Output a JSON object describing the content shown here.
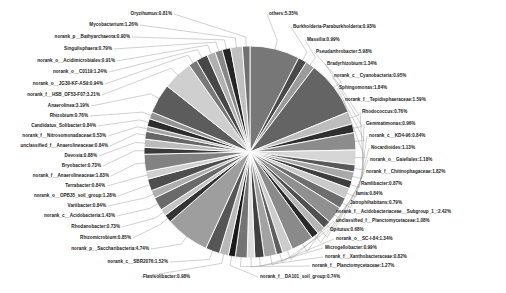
{
  "chart_data": {
    "type": "pie",
    "title": "",
    "xlabel": "",
    "ylabel": "",
    "legend_position": "none",
    "grid": false,
    "value_unit": "percent",
    "label_format": "{name}:{value}%",
    "slice_stroke": "#ffffff",
    "palette": "grayscale",
    "categories": [
      "others",
      "Burkholderia-Paraburkholderia",
      "Massilia",
      "Pseudarthrobacter",
      "Bradyrhizobium",
      "norank_c__Cyanobacteria",
      "Sphingomonas",
      "norank_f__Tepidisphaeraceae",
      "Rhodococcus",
      "Gemmatimonas",
      "norank_c__KD4-96",
      "Nocardioides",
      "norank_o__Gaiellales",
      "norank_f__Chitinophagaceae",
      "Ramlibacter",
      "Iamia",
      "Jatrophihabitans",
      "norank_f__Acidobacteriaceae__Subgroup_1_",
      "unclassified_f__Planctomycetaceae",
      "Opitutus",
      "norank_o__SC-I-84",
      "Microgellobacter",
      "norank_f__Xanthobacteraceae",
      "norank_f__Planctomycetaceae",
      "norank_f__DA101_soil_group",
      "Flavisolibacter",
      "norank_c__SBR2076",
      "norank_p__Saccharibacteria",
      "Rhizomicrobium",
      "Rhodanobacter",
      "norank_c__Acidobacteria",
      "Variibacter",
      "norank_o__OPB35_soil_group",
      "Terrabacter",
      "norank_f__Anaerolineaceae",
      "Bryobacter",
      "Devosia",
      "unclassified_f__Anaerolineaceae",
      "norank_f__Nitrosomonadaceae",
      "Candidatus_Solibacter",
      "Rhizobium",
      "Anaerolinea",
      "norank_f__HSB_OF53-F07",
      "norank_o__JG30-KF-AS9",
      "norank_o__C0119",
      "norank_o__Acidimicrobiales",
      "Singulisphaera",
      "norank_p__Bathyarchaeota",
      "Mycobacterium",
      "Oryzihumus"
    ],
    "values": [
      5.35,
      0.93,
      0.99,
      5.98,
      1.34,
      0.95,
      1.84,
      1.59,
      0.76,
      0.96,
      0.84,
      1.13,
      1.18,
      1.82,
      0.87,
      0.84,
      0.79,
      2.42,
      1.08,
      0.68,
      1.34,
      0.99,
      0.82,
      1.27,
      0.74,
      0.98,
      1.52,
      4.74,
      0.85,
      0.73,
      1.43,
      0.84,
      1.28,
      0.84,
      1.83,
      0.73,
      0.88,
      0.84,
      0.53,
      0.84,
      0.76,
      3.19,
      3.21,
      0.94,
      1.24,
      0.91,
      0.79,
      0.9,
      1.26,
      0.81
    ],
    "colors": [
      "#777777",
      "#4a4a4a",
      "#9b9b9b",
      "#646464",
      "#bdbdbd",
      "#2f2f2f",
      "#8c8c8c",
      "#d6d6d6",
      "#595959",
      "#a8a8a8",
      "#3d3d3d",
      "#c9c9c9",
      "#6e6e6e",
      "#909090",
      "#505050",
      "#b5b5b5",
      "#2a2a2a",
      "#8a8a8a",
      "#cccccc",
      "#5f5f5f",
      "#a2a2a2",
      "#404040",
      "#dddddd",
      "#747474",
      "#1a1a1a",
      "#b8b8b8",
      "#565656",
      "#9e9e9e",
      "#343434",
      "#c4c4c4",
      "#6a6a6a",
      "#adadad",
      "#4e4e4e",
      "#d0d0d0",
      "#828282",
      "#3a3a3a",
      "#bbbbbb",
      "#666666",
      "#a5a5a5",
      "#2d2d2d",
      "#949494",
      "#5c5c5c",
      "#cfcfcf",
      "#787878",
      "#474747",
      "#b0b0b0",
      "#878787",
      "#252525",
      "#c0c0c0",
      "#707070"
    ],
    "labels": [
      {
        "name": "others",
        "value": "5.35",
        "text": "others:5.35%",
        "side": "r",
        "x": 269,
        "y": 14
      },
      {
        "name": "Burkholderia-Paraburkholderia",
        "value": "0.93",
        "text": "Burkholderia-Paraburkholderia:0.93%",
        "side": "r",
        "x": 293,
        "y": 27
      },
      {
        "name": "Massilia",
        "value": "0.99",
        "text": "Massilia:0.99%",
        "side": "r",
        "x": 307,
        "y": 40
      },
      {
        "name": "Pseudarthrobacter",
        "value": "5.98",
        "text": "Pseudarthrobacter:5.98%",
        "side": "r",
        "x": 316,
        "y": 52
      },
      {
        "name": "Bradyrhizobium",
        "value": "1.34",
        "text": "Bradyrhizobium:1.34%",
        "side": "r",
        "x": 327,
        "y": 64
      },
      {
        "name": "norank_c__Cyanobacteria",
        "value": "0.95",
        "text": "norank_c__Cyanobacteria:0.95%",
        "side": "r",
        "x": 334,
        "y": 76
      },
      {
        "name": "Sphingomonas",
        "value": "1.84",
        "text": "Sphingomonas:1.84%",
        "side": "r",
        "x": 339,
        "y": 88
      },
      {
        "name": "norank_f__Tepidisphaeraceae",
        "value": "1.59",
        "text": "norank_f__Tepidisphaeraceae:1.59%",
        "side": "r",
        "x": 345,
        "y": 100
      },
      {
        "name": "Rhodococcus",
        "value": "0.76",
        "text": "Rhodococcus:0.76%",
        "side": "r",
        "x": 362,
        "y": 112
      },
      {
        "name": "Gemmatimonas",
        "value": "0.96",
        "text": "Gemmatimonas:0.96%",
        "side": "r",
        "x": 366,
        "y": 124
      },
      {
        "name": "norank_c__KD4-96",
        "value": "0.84",
        "text": "norank_c__KD4-96:0.84%",
        "side": "r",
        "x": 369,
        "y": 136
      },
      {
        "name": "Nocardioides",
        "value": "1.13",
        "text": "Nocardioides:1.13%",
        "side": "r",
        "x": 371,
        "y": 148
      },
      {
        "name": "norank_o__Gaiellales",
        "value": "1.18",
        "text": "norank_o__Gaiellales:1.18%",
        "side": "r",
        "x": 370,
        "y": 160
      },
      {
        "name": "norank_f__Chitinophagaceae",
        "value": "1.82",
        "text": "norank_f__Chitinophagaceae:1.82%",
        "side": "r",
        "x": 366,
        "y": 172
      },
      {
        "name": "Ramlibacter",
        "value": "0.87",
        "text": "Ramlibacter:0.87%",
        "side": "r",
        "x": 361,
        "y": 184
      },
      {
        "name": "Iamia",
        "value": "0.84",
        "text": "Iamia:0.84%",
        "side": "r",
        "x": 356,
        "y": 194
      },
      {
        "name": "Jatrophihabitans",
        "value": "0.79",
        "text": "Jatrophihabitans:0.79%",
        "side": "r",
        "x": 350,
        "y": 203
      },
      {
        "name": "norank_f__Acidobacteriaceae__Subgroup_1_",
        "value": "2.42",
        "text": "norank_f__Acidobacteriaceae__Subgroup_1_:2.42%",
        "side": "r",
        "x": 336,
        "y": 212
      },
      {
        "name": "unclassified_f__Planctomycetaceae",
        "value": "1.08",
        "text": "unclassified_f__Planctomycetaceae:1.08%",
        "side": "r",
        "x": 336,
        "y": 221
      },
      {
        "name": "Opitutus",
        "value": "0.68",
        "text": "Opitutus:0.68%",
        "side": "r",
        "x": 330,
        "y": 230
      },
      {
        "name": "norank_o__SC-I-84",
        "value": "1.34",
        "text": "norank_o__SC-I-84:1.34%",
        "side": "r",
        "x": 336,
        "y": 239
      },
      {
        "name": "Microgellobacter",
        "value": "0.99",
        "text": "Microgellobacter:0.99%",
        "side": "r",
        "x": 325,
        "y": 248
      },
      {
        "name": "norank_f__Xanthobacteraceae",
        "value": "0.82",
        "text": "norank_f__Xanthobacteraceae:0.82%",
        "side": "r",
        "x": 325,
        "y": 257
      },
      {
        "name": "norank_f__Planctomycetaceae",
        "value": "1.27",
        "text": "norank_f__Planctomycetaceae:1.27%",
        "side": "r",
        "x": 312,
        "y": 266
      },
      {
        "name": "norank_f__DA101_soil_group",
        "value": "0.74",
        "text": "norank_f__DA101_soil_group:0.74%",
        "side": "r",
        "x": 260,
        "y": 277
      },
      {
        "name": "Flavisolibacter",
        "value": "0.98",
        "text": "Flavisolibacter:0.98%",
        "side": "r",
        "x": 143,
        "y": 277
      },
      {
        "name": "norank_c__SBR2076",
        "value": "1.52",
        "text": "norank_c__SBR2076:1.52%",
        "side": "l",
        "x": 168,
        "y": 262
      },
      {
        "name": "norank_p__Saccharibacteria",
        "value": "4.74",
        "text": "norank_p__Saccharibacteria:4.74%",
        "side": "l",
        "x": 149,
        "y": 249
      },
      {
        "name": "Rhizomicrobium",
        "value": "0.85",
        "text": "Rhizomicrobium:0.85%",
        "side": "l",
        "x": 131,
        "y": 238
      },
      {
        "name": "Rhodanobacter",
        "value": "0.73",
        "text": "Rhodanobacter:0.73%",
        "side": "l",
        "x": 120,
        "y": 227
      },
      {
        "name": "norank_c__Acidobacteria",
        "value": "1.43",
        "text": "norank_c__Acidobacteria:1.43%",
        "side": "l",
        "x": 115,
        "y": 216
      },
      {
        "name": "Variibacter",
        "value": "0.84",
        "text": "Variibacter:0.84%",
        "side": "l",
        "x": 106,
        "y": 206
      },
      {
        "name": "norank_o__OPB35_soil_group",
        "value": "1.28",
        "text": "norank_o__OPB35_soil_group:1.28%",
        "side": "l",
        "x": 116,
        "y": 196
      },
      {
        "name": "Terrabacter",
        "value": "0.84",
        "text": "Terrabacter:0.84%",
        "side": "l",
        "x": 105,
        "y": 186
      },
      {
        "name": "norank_f__Anaerolineaceae",
        "value": "1.83",
        "text": "norank_f__Anaerolineaceae:1.83%",
        "side": "l",
        "x": 109,
        "y": 176
      },
      {
        "name": "Bryobacter",
        "value": "0.73",
        "text": "Bryobacter:0.73%",
        "side": "l",
        "x": 101,
        "y": 166
      },
      {
        "name": "Devosia",
        "value": "0.88",
        "text": "Devosia:0.88%",
        "side": "l",
        "x": 97,
        "y": 156
      },
      {
        "name": "unclassified_f__Anaerolineaceae",
        "value": "0.84",
        "text": "unclassified_f__Anaerolineaceae:0.84%",
        "side": "l",
        "x": 108,
        "y": 146
      },
      {
        "name": "norank_f__Nitrosomonadaceae",
        "value": "0.53",
        "text": "norank_f__Nitrosomonadaceae:0.53%",
        "side": "l",
        "x": 106,
        "y": 136
      },
      {
        "name": "Candidatus_Solibacter",
        "value": "0.84",
        "text": "Candidatus_Solibacter:0.84%",
        "side": "l",
        "x": 96,
        "y": 126
      },
      {
        "name": "Rhizobium",
        "value": "0.76",
        "text": "Rhizobium:0.76%",
        "side": "l",
        "x": 88,
        "y": 116
      },
      {
        "name": "Anaerolinea",
        "value": "3.19",
        "text": "Anaerolinea:3.19%",
        "side": "l",
        "x": 89,
        "y": 106
      },
      {
        "name": "norank_f__HSB_OF53-F07",
        "value": "3.21",
        "text": "norank_f__HSB_OF53-F07:3.21%",
        "side": "l",
        "x": 100,
        "y": 95
      },
      {
        "name": "norank_o__JG30-KF-AS9",
        "value": "0.94",
        "text": "norank_o__JG30-KF-AS9:0.94%",
        "side": "l",
        "x": 103,
        "y": 84
      },
      {
        "name": "norank_o__C0119",
        "value": "1.24",
        "text": "norank_o__C0119:1.24%",
        "side": "l",
        "x": 107,
        "y": 72
      },
      {
        "name": "norank_o__Acidimicrobiales",
        "value": "0.91",
        "text": "norank_o__Acidimicrobiales:0.91%",
        "side": "l",
        "x": 115,
        "y": 61
      },
      {
        "name": "Singulisphaera",
        "value": "0.79",
        "text": "Singulisphaera:0.79%",
        "side": "l",
        "x": 112,
        "y": 49
      },
      {
        "name": "norank_p__Bathyarchaeota",
        "value": "0.90",
        "text": "norank_p__Bathyarchaeota:0.90%",
        "side": "l",
        "x": 130,
        "y": 37
      },
      {
        "name": "Mycobacterium",
        "value": "1.26",
        "text": "Mycobacterium:1.26%",
        "side": "l",
        "x": 138,
        "y": 25
      },
      {
        "name": "Oryzihumus",
        "value": "0.81",
        "text": "Oryzihumus:0.81%",
        "side": "l",
        "x": 172,
        "y": 14
      }
    ],
    "geometry": {
      "cx": 250,
      "cy": 152,
      "r": 106,
      "start_angle_deg": -90
    }
  }
}
